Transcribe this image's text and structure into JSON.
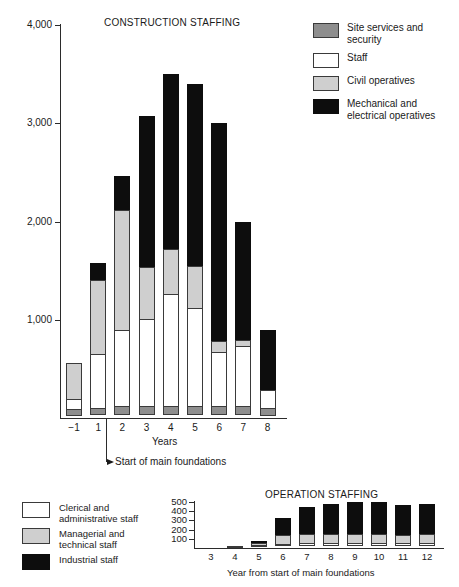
{
  "chart_data": [
    {
      "type": "bar",
      "id": "construction-staffing",
      "title": "CONSTRUCTION STAFFING",
      "xlabel": "Years",
      "ylabel": "",
      "ylim": [
        0,
        4000
      ],
      "yticks": [
        "1,000",
        "2,000",
        "3,000",
        "4,000"
      ],
      "ytick_values": [
        1000,
        2000,
        3000,
        4000
      ],
      "grid": false,
      "stacked": true,
      "legend_position": "top-right",
      "categories": [
        "-1",
        "1",
        "2",
        "3",
        "4",
        "5",
        "6",
        "7",
        "8"
      ],
      "series": [
        {
          "name": "Site services and\nsecurity",
          "key": "site",
          "color": "#8e8e8e",
          "values": [
            70,
            70,
            90,
            90,
            95,
            90,
            90,
            90,
            85
          ]
        },
        {
          "name": "Staff",
          "key": "staff",
          "color": "#ffffff",
          "values": [
            110,
            560,
            790,
            900,
            1150,
            1010,
            560,
            620,
            185
          ]
        },
        {
          "name": "Civil operatives",
          "key": "civil",
          "color": "#cfcfcf",
          "values": [
            380,
            760,
            1230,
            540,
            460,
            440,
            125,
            75,
            0
          ]
        },
        {
          "name": "Mechanical and\nelectrical operatives",
          "key": "mech",
          "color": "#0d0d0d",
          "values": [
            0,
            190,
            350,
            1540,
            1795,
            1860,
            2225,
            1215,
            630
          ]
        }
      ],
      "totals": [
        560,
        1580,
        2460,
        3070,
        3500,
        3400,
        3000,
        2000,
        900
      ],
      "annotation": {
        "text": "Start of main foundations",
        "at_category": "1",
        "arrow": "left"
      }
    },
    {
      "type": "bar",
      "id": "operation-staffing",
      "title": "OPERATION STAFFING",
      "xlabel": "Year from start of main foundations",
      "ylabel": "",
      "ylim": [
        0,
        500
      ],
      "yticks": [
        "100",
        "200",
        "300",
        "400",
        "500"
      ],
      "ytick_values": [
        100,
        200,
        300,
        400,
        500
      ],
      "grid": false,
      "stacked": true,
      "legend_position": "left",
      "categories": [
        "3",
        "4",
        "5",
        "6",
        "7",
        "8",
        "9",
        "10",
        "11",
        "12"
      ],
      "series": [
        {
          "name": "Clerical and\nadministrative staff",
          "key": "clerical",
          "color": "#ffffff",
          "values": [
            0,
            5,
            15,
            25,
            30,
            30,
            30,
            30,
            30,
            30
          ]
        },
        {
          "name": "Managerial and\ntechnical staff",
          "key": "managerial",
          "color": "#cfcfcf",
          "values": [
            0,
            5,
            25,
            100,
            110,
            110,
            115,
            115,
            105,
            110
          ]
        },
        {
          "name": "Industrial staff",
          "key": "industrial",
          "color": "#0d0d0d",
          "values": [
            0,
            10,
            35,
            205,
            310,
            340,
            355,
            355,
            335,
            340
          ]
        }
      ],
      "totals": [
        0,
        20,
        75,
        330,
        450,
        480,
        500,
        500,
        470,
        480
      ]
    }
  ],
  "construction": {
    "title": "CONSTRUCTION STAFFING",
    "axis_name": "Years",
    "annotation_text": "Start of main foundations",
    "ylabels": [
      "4,000",
      "3,000",
      "2,000",
      "1,000"
    ],
    "xlabels": [
      "-1",
      "1",
      "2",
      "3",
      "4",
      "5",
      "6",
      "7",
      "8"
    ],
    "legend": [
      {
        "label": "Site services and\nsecurity",
        "color": "#8e8e8e",
        "key": "site"
      },
      {
        "label": "Staff",
        "color": "#ffffff",
        "key": "staff"
      },
      {
        "label": "Civil operatives",
        "color": "#cfcfcf",
        "key": "civil"
      },
      {
        "label": "Mechanical and\nelectrical operatives",
        "color": "#0d0d0d",
        "key": "mech"
      }
    ]
  },
  "operation": {
    "title": "OPERATION STAFFING",
    "axis_name": "Year from start of main foundations",
    "ylabels": [
      "500",
      "400",
      "300",
      "200",
      "100"
    ],
    "xlabels": [
      "3",
      "4",
      "5",
      "6",
      "7",
      "8",
      "9",
      "10",
      "11",
      "12"
    ],
    "legend": [
      {
        "label": "Clerical and\nadministrative staff",
        "color": "#ffffff",
        "key": "clerical"
      },
      {
        "label": "Managerial and\ntechnical staff",
        "color": "#cfcfcf",
        "key": "managerial"
      },
      {
        "label": "Industrial staff",
        "color": "#0d0d0d",
        "key": "industrial"
      }
    ]
  }
}
